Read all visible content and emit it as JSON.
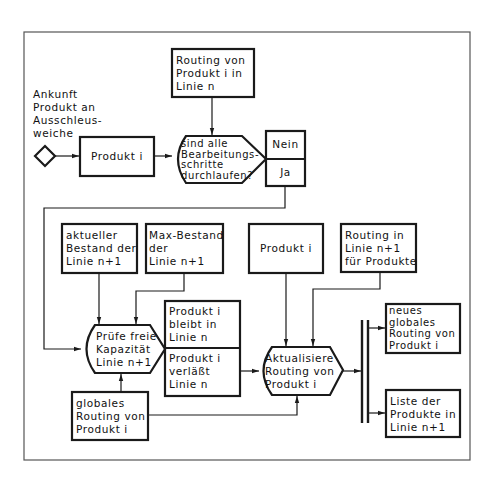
{
  "diagram": {
    "type": "flowchart",
    "language": "de",
    "colors": {
      "stroke": "#1a1a1a",
      "background": "#ffffff",
      "frame": "#555555"
    },
    "start": {
      "symbol": "diamond",
      "label": "Ankunft\nProdukt an\nAusschleus-\nweiche"
    },
    "nodes": {
      "produkt_i_start": "Produkt i",
      "routing_linie_n": "Routing von\nProdukt i in\nLinie n",
      "decision_all_steps": "sind alle\nBearbeitungs-\nschritte\ndurchlaufen?",
      "decision_no": "Nein",
      "decision_yes": "Ja",
      "aktueller_bestand": "aktueller\nBestand der\nLinie n+1",
      "max_bestand": "Max-Bestand\nder\nLinie n+1",
      "pruefe_kapazitaet": "Prüfe freie\nKapazität\nLinie n+1",
      "result_bleibt": "Produkt i\nbleibt in\nLinie n",
      "result_verlaesst": "Produkt i\nverläßt\nLinie n",
      "globales_routing": "globales\nRouting von\nProdukt i",
      "produkt_i_second": "Produkt i",
      "routing_linie_n1": "Routing in\nLinie n+1\nfür Produkte",
      "aktualisiere_routing": "Aktualisiere\nRouting von\nProdukt i",
      "neues_globales_routing": "neues\nglobales\nRouting von\nProdukt i",
      "liste_produkte": "Liste der\nProdukte in\nLinie n+1"
    },
    "edges": [
      {
        "from": "start",
        "to": "produkt_i_start"
      },
      {
        "from": "produkt_i_start",
        "to": "decision_all_steps"
      },
      {
        "from": "routing_linie_n",
        "to": "decision_all_steps"
      },
      {
        "from": "decision_yes",
        "to": "pruefe_kapazitaet"
      },
      {
        "from": "aktueller_bestand",
        "to": "pruefe_kapazitaet"
      },
      {
        "from": "max_bestand",
        "to": "pruefe_kapazitaet"
      },
      {
        "from": "globales_routing",
        "to": "pruefe_kapazitaet"
      },
      {
        "from": "result_verlaesst",
        "to": "aktualisiere_routing"
      },
      {
        "from": "produkt_i_second",
        "to": "aktualisiere_routing"
      },
      {
        "from": "routing_linie_n1",
        "to": "aktualisiere_routing"
      },
      {
        "from": "globales_routing",
        "to": "aktualisiere_routing"
      },
      {
        "from": "aktualisiere_routing",
        "to": "parallel_split"
      },
      {
        "from": "parallel_split",
        "to": "neues_globales_routing"
      },
      {
        "from": "parallel_split",
        "to": "liste_produkte"
      }
    ]
  }
}
